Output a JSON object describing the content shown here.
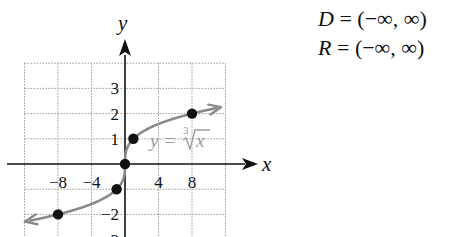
{
  "chart_data": {
    "type": "line",
    "title": "",
    "xlabel": "x",
    "ylabel": "y",
    "xlim": [
      -12,
      12
    ],
    "ylim": [
      -3,
      4
    ],
    "grid": true,
    "x_grid_step": 4,
    "y_grid_step": 1,
    "x_ticks": [
      {
        "value": -8,
        "label": "−8"
      },
      {
        "value": -4,
        "label": "−4"
      },
      {
        "value": 4,
        "label": "4"
      },
      {
        "value": 8,
        "label": "8"
      }
    ],
    "y_ticks": [
      {
        "value": 3,
        "label": "3"
      },
      {
        "value": 2,
        "label": "2"
      },
      {
        "value": 1,
        "label": "1"
      },
      {
        "value": -2,
        "label": "−2"
      },
      {
        "value": -3,
        "label": "−3"
      }
    ],
    "series": [
      {
        "name": "y = ∛x",
        "function": "cbrt",
        "x_range": [
          -11.5,
          11
        ],
        "color": "#8a8a8a",
        "arrows": "both"
      }
    ],
    "points": [
      {
        "x": -8,
        "y": -2
      },
      {
        "x": -1,
        "y": -1
      },
      {
        "x": 0,
        "y": 0
      },
      {
        "x": 1,
        "y": 1
      },
      {
        "x": 8,
        "y": 2
      }
    ],
    "annotation": {
      "prefix": "y = ",
      "index": "3",
      "radicand": "x"
    },
    "point_color": "#111111",
    "axis_color": "#111111",
    "grid_color": "#9a9a9a"
  },
  "domain_range": {
    "domain": {
      "var": "D",
      "eq": " = ",
      "value": "(−∞, ∞)"
    },
    "range": {
      "var": "R",
      "eq": " = ",
      "value": "(−∞, ∞)"
    }
  }
}
